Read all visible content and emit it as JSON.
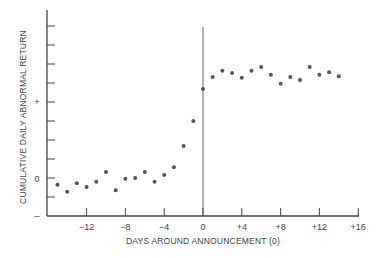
{
  "chart_data": {
    "type": "scatter",
    "title": "",
    "xlabel": "DAYS AROUND ANNOUNCEMENT (0)",
    "ylabel": "CUMULATIVE DAILY ABNORMAL RETURN",
    "xlim": [
      -16,
      16
    ],
    "ylim": [
      -0.5,
      2.2
    ],
    "grid": false,
    "legend": null,
    "x_ticks": [
      -12,
      -8,
      -4,
      0,
      4,
      8,
      12,
      16
    ],
    "x_tick_labels": [
      "−12",
      "−8",
      "−4",
      "0",
      "+4",
      "+8",
      "+12",
      "+16"
    ],
    "y_ticks_labeled": [
      {
        "value": 1,
        "label": "+"
      },
      {
        "value": 0,
        "label": "0"
      },
      {
        "value": -0.5,
        "label": "–"
      }
    ],
    "y_minor_tick_step": 0.25,
    "vertical_reference_line": {
      "x": 0
    },
    "series": [
      {
        "name": "Cumulative daily abnormal return",
        "x": [
          -15,
          -14,
          -13,
          -12,
          -11,
          -10,
          -9,
          -8,
          -7,
          -6,
          -5,
          -4,
          -3,
          -2,
          -1,
          0,
          1,
          2,
          3,
          4,
          5,
          6,
          7,
          8,
          9,
          10,
          11,
          12,
          13,
          14
        ],
        "values": [
          -0.09,
          -0.18,
          -0.07,
          -0.12,
          -0.05,
          0.08,
          -0.16,
          -0.01,
          0.0,
          0.08,
          -0.05,
          0.04,
          0.14,
          0.42,
          0.75,
          1.17,
          1.33,
          1.41,
          1.38,
          1.32,
          1.41,
          1.46,
          1.36,
          1.24,
          1.33,
          1.29,
          1.46,
          1.36,
          1.39,
          1.34
        ]
      }
    ]
  },
  "labels": {
    "xlabel": "DAYS AROUND ANNOUNCEMENT (0)",
    "ylabel": "CUMULATIVE DAILY ABNORMAL RETURN",
    "y_plus": "+",
    "y_zero": "0",
    "y_minus": "–",
    "x_ticks": [
      "−12",
      "−8",
      "−4",
      "0",
      "+4",
      "+8",
      "+12",
      "+16"
    ]
  },
  "colors": {
    "axis": "#444444",
    "points": "#555555",
    "text": "#444444"
  }
}
